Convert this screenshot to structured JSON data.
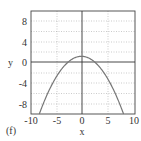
{
  "panel_label": "(f)",
  "chart_data": {
    "type": "line",
    "title": "",
    "xlabel": "x",
    "ylabel": "y",
    "xlim": [
      -10,
      10
    ],
    "ylim": [
      -10,
      10
    ],
    "grid": true,
    "x_ticks": [
      "-10",
      "-5",
      "0",
      "5",
      "10"
    ],
    "y_ticks": [
      "8",
      "4",
      "0",
      "-4",
      "-8"
    ],
    "series": [
      {
        "name": "curve",
        "shape": "downward parabola",
        "vertex": [
          -0.3,
          1.2
        ],
        "x": [
          -8.4,
          -7,
          -5,
          -3,
          -2,
          -1,
          -0.3,
          0,
          1,
          2,
          3,
          5,
          7,
          7.8
        ],
        "y": [
          -10,
          -6.3,
          -2.6,
          -0.65,
          0.2,
          0.9,
          1.2,
          1.18,
          0.9,
          0.3,
          -0.65,
          -3.0,
          -6.4,
          -8.6
        ],
        "color": "#777777"
      }
    ]
  }
}
